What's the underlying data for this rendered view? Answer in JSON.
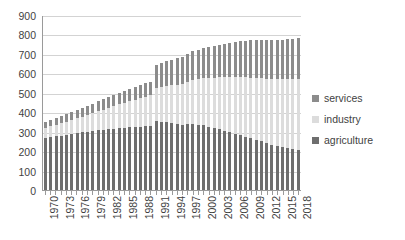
{
  "chart_data": {
    "type": "bar",
    "stacked": true,
    "title": "",
    "xlabel": "",
    "ylabel": "",
    "ylim": [
      0,
      900
    ],
    "ytick_step": 100,
    "grid": true,
    "legend_position": "right",
    "x_tick_label_every": 3,
    "x_tick_labels": [
      "1970",
      "1973",
      "1976",
      "1979",
      "1982",
      "1985",
      "1988",
      "1991",
      "1994",
      "1997",
      "2000",
      "2003",
      "2006",
      "2009",
      "2012",
      "2015",
      "2018"
    ],
    "yticks": [
      "0",
      "100",
      "200",
      "300",
      "400",
      "500",
      "600",
      "700",
      "800",
      "900"
    ],
    "categories": [
      "1970",
      "1971",
      "1972",
      "1973",
      "1974",
      "1975",
      "1976",
      "1977",
      "1978",
      "1979",
      "1980",
      "1981",
      "1982",
      "1983",
      "1984",
      "1985",
      "1986",
      "1987",
      "1988",
      "1989",
      "1990",
      "1991",
      "1992",
      "1993",
      "1994",
      "1995",
      "1996",
      "1997",
      "1998",
      "1999",
      "2000",
      "2001",
      "2002",
      "2003",
      "2004",
      "2005",
      "2006",
      "2007",
      "2008",
      "2009",
      "2010",
      "2011",
      "2012",
      "2013",
      "2014",
      "2015",
      "2016",
      "2017",
      "2018"
    ],
    "series": [
      {
        "name": "agriculture",
        "color": "#6e6e6e",
        "values": [
          268,
          272,
          276,
          280,
          284,
          288,
          292,
          296,
          300,
          304,
          308,
          310,
          313,
          316,
          318,
          320,
          322,
          324,
          326,
          328,
          330,
          355,
          352,
          348,
          344,
          340,
          336,
          338,
          340,
          336,
          332,
          326,
          320,
          314,
          306,
          298,
          290,
          282,
          274,
          266,
          258,
          250,
          242,
          234,
          228,
          222,
          216,
          212,
          208
        ]
      },
      {
        "name": "industry",
        "color": "#dcdcdc",
        "values": [
          52,
          56,
          60,
          64,
          68,
          72,
          76,
          80,
          86,
          92,
          98,
          104,
          110,
          116,
          122,
          128,
          134,
          140,
          146,
          152,
          158,
          170,
          178,
          186,
          194,
          202,
          210,
          218,
          226,
          234,
          242,
          250,
          258,
          266,
          274,
          282,
          290,
          298,
          306,
          312,
          318,
          324,
          330,
          336,
          342,
          348,
          354,
          358,
          362
        ]
      },
      {
        "name": "services",
        "color": "#8c8c8c",
        "values": [
          30,
          32,
          34,
          36,
          38,
          40,
          42,
          44,
          46,
          48,
          50,
          52,
          54,
          56,
          58,
          60,
          62,
          64,
          66,
          68,
          70,
          120,
          124,
          128,
          132,
          136,
          140,
          144,
          148,
          152,
          156,
          160,
          164,
          168,
          172,
          176,
          180,
          184,
          188,
          192,
          194,
          196,
          198,
          200,
          202,
          204,
          206,
          208,
          210
        ]
      }
    ]
  },
  "legend": {
    "items": [
      {
        "label": "services",
        "color": "#8c8c8c"
      },
      {
        "label": "industry",
        "color": "#dcdcdc"
      },
      {
        "label": "agriculture",
        "color": "#6e6e6e"
      }
    ]
  }
}
